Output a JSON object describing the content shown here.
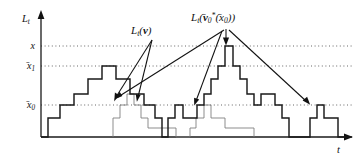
{
  "figure": {
    "title_semantic": "local-time-step-function-diagram",
    "axes": {
      "y_axis_label": "L",
      "y_axis_label_sub": "t",
      "x_axis_label": "t",
      "y_ticks": [
        {
          "id": "x",
          "label_main": "x",
          "label_sub": "",
          "label_bar": false,
          "y_px": 46
        },
        {
          "id": "xbar1",
          "label_main": "x",
          "label_sub": "1",
          "label_bar": true,
          "y_px": 66
        },
        {
          "id": "xbar0",
          "label_main": "x",
          "label_sub": "0",
          "label_bar": true,
          "y_px": 105
        }
      ],
      "origin_px": {
        "x": 41,
        "y": 137
      },
      "x_axis_end_px": 352,
      "y_axis_top_px": 12,
      "gridline_start_px": 41,
      "gridline_end_px": 352
    },
    "annotations": [
      {
        "id": "Lt-v",
        "parts": [
          "L",
          "t",
          "(",
          "v",
          ")"
        ],
        "label_main": "L",
        "label_sub": "t",
        "label_arg": "v",
        "label_arg_bold": true,
        "text_x_px": 146,
        "text_y_px": 33,
        "vertex_px": {
          "x": 152,
          "y": 40
        },
        "targets_px": [
          {
            "x": 115,
            "y": 100
          },
          {
            "x": 137,
            "y": 100
          }
        ]
      },
      {
        "id": "Lt-v0star-x0bar",
        "label_main": "L",
        "label_sub": "t",
        "label_arg": "v0*(x0)",
        "text_x_px": 196,
        "text_y_px": 20,
        "vertex_px": {
          "x": 226,
          "y": 27
        },
        "targets_px": [
          {
            "x": 226,
            "y": 44
          },
          {
            "x": 116,
            "y": 99
          },
          {
            "x": 193,
            "y": 104
          },
          {
            "x": 310,
            "y": 104
          }
        ]
      }
    ]
  },
  "chart_data": {
    "type": "line",
    "title": "",
    "xlabel": "t",
    "ylabel": "L_t",
    "grid": true,
    "legend": "none",
    "xlim": [
      0,
      311
    ],
    "ylim": [
      0,
      125
    ],
    "y_tick_values": [
      20,
      59,
      79
    ],
    "y_tick_labels": [
      "x̅0",
      "x̅1",
      "x"
    ],
    "series": [
      {
        "name": "L_t(v0*(x0)) primary staircase",
        "style": "step-heavy",
        "color": "#1a1a1a",
        "points_px": [
          [
            41,
            137
          ],
          [
            48,
            137
          ],
          [
            48,
            118
          ],
          [
            60,
            118
          ],
          [
            60,
            105
          ],
          [
            74,
            105
          ],
          [
            74,
            94
          ],
          [
            88,
            94
          ],
          [
            88,
            79
          ],
          [
            102,
            79
          ],
          [
            102,
            66
          ],
          [
            116,
            66
          ],
          [
            116,
            79
          ],
          [
            130,
            79
          ],
          [
            130,
            94
          ],
          [
            144,
            94
          ],
          [
            144,
            105
          ],
          [
            155,
            105
          ],
          [
            155,
            118
          ],
          [
            162,
            118
          ],
          [
            162,
            137
          ],
          [
            168,
            137
          ],
          [
            168,
            118
          ],
          [
            175,
            118
          ],
          [
            175,
            105
          ],
          [
            183,
            105
          ],
          [
            183,
            118
          ],
          [
            197,
            118
          ],
          [
            197,
            105
          ],
          [
            204,
            105
          ],
          [
            204,
            94
          ],
          [
            211,
            94
          ],
          [
            211,
            79
          ],
          [
            218,
            79
          ],
          [
            218,
            66
          ],
          [
            225,
            66
          ],
          [
            225,
            46
          ],
          [
            233,
            46
          ],
          [
            233,
            66
          ],
          [
            240,
            66
          ],
          [
            240,
            79
          ],
          [
            247,
            79
          ],
          [
            247,
            94
          ],
          [
            254,
            94
          ],
          [
            254,
            105
          ],
          [
            261,
            105
          ],
          [
            261,
            94
          ],
          [
            275,
            94
          ],
          [
            275,
            105
          ],
          [
            282,
            105
          ],
          [
            282,
            118
          ],
          [
            289,
            118
          ],
          [
            289,
            137
          ],
          [
            310,
            137
          ],
          [
            310,
            118
          ],
          [
            317,
            118
          ],
          [
            317,
            105
          ],
          [
            324,
            105
          ],
          [
            324,
            118
          ],
          [
            338,
            118
          ],
          [
            338,
            137
          ],
          [
            352,
            137
          ]
        ]
      },
      {
        "name": "L_t(v) secondary staircase",
        "style": "step-light",
        "color": "#7a7a7a",
        "points_px": [
          [
            113,
            137
          ],
          [
            113,
            118
          ],
          [
            120,
            118
          ],
          [
            120,
            105
          ],
          [
            127,
            105
          ],
          [
            127,
            94
          ],
          [
            134,
            94
          ],
          [
            134,
            105
          ],
          [
            141,
            105
          ],
          [
            141,
            118
          ],
          [
            148,
            118
          ],
          [
            148,
            128
          ],
          [
            176,
            128
          ],
          [
            176,
            137
          ],
          [
            190,
            137
          ],
          [
            190,
            128
          ],
          [
            196,
            128
          ],
          [
            196,
            118
          ],
          [
            204,
            118
          ],
          [
            204,
            105
          ],
          [
            211,
            105
          ],
          [
            211,
            118
          ],
          [
            225,
            118
          ],
          [
            225,
            128
          ],
          [
            254,
            128
          ],
          [
            254,
            137
          ]
        ]
      }
    ]
  }
}
